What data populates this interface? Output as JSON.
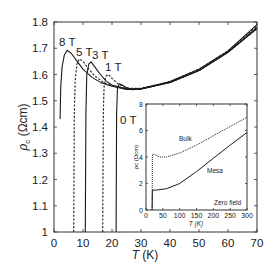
{
  "chart_data": [
    {
      "type": "line",
      "title": "",
      "xlabel": "T (K)",
      "ylabel": "ρc (Ωcm)",
      "xlim": [
        0,
        70
      ],
      "ylim": [
        1,
        1.8
      ],
      "xticks": [
        "0",
        "10",
        "20",
        "30",
        "40",
        "50",
        "60",
        "70"
      ],
      "yticks": [
        "1",
        "1.1",
        "1.2",
        "1.3",
        "1.4",
        "1.5",
        "1.6",
        "1.7",
        "1.8"
      ],
      "grid": false,
      "legend": "inline labels",
      "series": [
        {
          "name": "8 T",
          "style": "solid",
          "points": [
            [
              2.1,
              1.43
            ],
            [
              2.3,
              1.55
            ],
            [
              2.8,
              1.63
            ],
            [
              3.6,
              1.675
            ],
            [
              4.6,
              1.692
            ],
            [
              6,
              1.68
            ],
            [
              8,
              1.65
            ],
            [
              10,
              1.62
            ],
            [
              13,
              1.59
            ],
            [
              16,
              1.57
            ],
            [
              20,
              1.555
            ],
            [
              25,
              1.543
            ],
            [
              30,
              1.545
            ],
            [
              40,
              1.57
            ],
            [
              50,
              1.615
            ],
            [
              60,
              1.685
            ],
            [
              70,
              1.775
            ]
          ]
        },
        {
          "name": "5 T",
          "style": "dashed",
          "points": [
            [
              6.8,
              1.0
            ],
            [
              7.0,
              1.45
            ],
            [
              7.3,
              1.58
            ],
            [
              7.9,
              1.64
            ],
            [
              8.8,
              1.66
            ],
            [
              10,
              1.65
            ],
            [
              12,
              1.62
            ],
            [
              14,
              1.595
            ],
            [
              17,
              1.57
            ],
            [
              20,
              1.557
            ],
            [
              25,
              1.545
            ],
            [
              30,
              1.545
            ],
            [
              40,
              1.57
            ],
            [
              50,
              1.615
            ],
            [
              60,
              1.685
            ],
            [
              70,
              1.775
            ]
          ]
        },
        {
          "name": "3 T",
          "style": "solid",
          "points": [
            [
              10.8,
              1.0
            ],
            [
              11.0,
              1.45
            ],
            [
              11.3,
              1.6
            ],
            [
              12,
              1.64
            ],
            [
              12.8,
              1.648
            ],
            [
              14,
              1.63
            ],
            [
              16,
              1.6
            ],
            [
              18,
              1.575
            ],
            [
              20,
              1.56
            ],
            [
              25,
              1.545
            ],
            [
              30,
              1.545
            ],
            [
              40,
              1.57
            ],
            [
              50,
              1.615
            ],
            [
              60,
              1.685
            ],
            [
              70,
              1.78
            ]
          ]
        },
        {
          "name": "1 T",
          "style": "dashed",
          "points": [
            [
              16.8,
              1.0
            ],
            [
              17.0,
              1.45
            ],
            [
              17.3,
              1.57
            ],
            [
              18,
              1.595
            ],
            [
              18.8,
              1.6
            ],
            [
              20,
              1.585
            ],
            [
              22,
              1.565
            ],
            [
              25,
              1.548
            ],
            [
              30,
              1.547
            ],
            [
              40,
              1.573
            ],
            [
              50,
              1.62
            ],
            [
              60,
              1.69
            ],
            [
              70,
              1.785
            ]
          ]
        },
        {
          "name": "0 T",
          "style": "solid",
          "points": [
            [
              21.4,
              1.0
            ],
            [
              21.6,
              1.45
            ],
            [
              21.9,
              1.55
            ],
            [
              22.6,
              1.565
            ],
            [
              23.5,
              1.56
            ],
            [
              25,
              1.55
            ],
            [
              27,
              1.542
            ],
            [
              30,
              1.545
            ],
            [
              40,
              1.573
            ],
            [
              50,
              1.62
            ],
            [
              60,
              1.69
            ],
            [
              70,
              1.79
            ]
          ]
        }
      ]
    },
    {
      "type": "line",
      "title": "inset",
      "xlabel": "T (K)",
      "ylabel": "ρc (Ωcm)",
      "xlim": [
        0,
        300
      ],
      "ylim": [
        0,
        8
      ],
      "xticks": [
        "0",
        "50",
        "100",
        "150",
        "200",
        "250",
        "300"
      ],
      "yticks": [
        "0",
        "2",
        "4",
        "6",
        "8"
      ],
      "annotation": "Zero field",
      "series": [
        {
          "name": "Bulk",
          "style": "dotted",
          "points": [
            [
              18,
              0
            ],
            [
              19,
              4.2
            ],
            [
              25,
              4.2
            ],
            [
              40,
              4.0
            ],
            [
              60,
              4.0
            ],
            [
              100,
              4.3
            ],
            [
              150,
              4.9
            ],
            [
              200,
              5.6
            ],
            [
              250,
              6.3
            ],
            [
              300,
              7.0
            ]
          ]
        },
        {
          "name": "Mesa",
          "style": "solid",
          "points": [
            [
              18,
              0
            ],
            [
              19,
              1.5
            ],
            [
              30,
              1.5
            ],
            [
              60,
              1.6
            ],
            [
              100,
              2.0
            ],
            [
              150,
              2.9
            ],
            [
              200,
              3.9
            ],
            [
              250,
              4.9
            ],
            [
              300,
              5.85
            ]
          ]
        }
      ]
    }
  ],
  "labels": {
    "xlabel_italic": "T",
    "xlabel_unit": " (K)",
    "ylabel_italic": "ρ",
    "ylabel_sub": "c",
    "ylabel_unit": " (Ωcm)",
    "field_8": "8 T",
    "field_5": "5 T",
    "field_3": "3 T",
    "field_1": "1 T",
    "field_0": "0 T",
    "inset_bulk": "Bulk",
    "inset_mesa": "Mesa",
    "inset_zero": "Zero field",
    "inset_xlabel": "T (K)",
    "inset_ylabel": "ρc (Ωcm)"
  },
  "main_xticks": [
    "0",
    "10",
    "20",
    "30",
    "40",
    "50",
    "60",
    "70"
  ],
  "main_yticks": [
    "1",
    "1.1",
    "1.2",
    "1.3",
    "1.4",
    "1.5",
    "1.6",
    "1.7",
    "1.8"
  ],
  "inset_xticks": [
    "0",
    "50",
    "100",
    "150",
    "200",
    "250",
    "300"
  ],
  "inset_yticks": [
    "0",
    "2",
    "4",
    "6",
    "8"
  ]
}
